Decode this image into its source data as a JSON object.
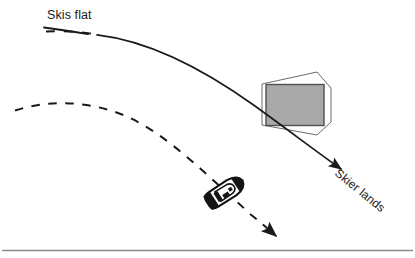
{
  "figure": {
    "type": "diagram",
    "background_color": "#ffffff",
    "width": 415,
    "height": 258
  },
  "labels": {
    "skis_flat": "Skis flat",
    "skier_lands": "Skier lands"
  },
  "colors": {
    "ink": "#1a1a1a",
    "ramp_fill": "#a9a9a9",
    "ramp_stroke": "#555555",
    "outline_stroke": "#666666",
    "water_line": "#8a8a8a",
    "boat_body": "#ffffff",
    "boat_outline": "#111111"
  },
  "elements": {
    "skier_path": {
      "name": "skier-flight-path",
      "style": "solid-with-dashed-start",
      "description": "skier trajectory arcing over the ramp and down to landing",
      "arrowhead": true,
      "points": [
        [
          44,
          31
        ],
        [
          96,
          35
        ],
        [
          160,
          56
        ],
        [
          225,
          88
        ],
        [
          290,
          127
        ],
        [
          345,
          172
        ]
      ]
    },
    "boat_path": {
      "name": "boat-wake-path",
      "style": "dashed",
      "description": "dashed curve showing boat track passing the ramp",
      "arrowhead": true,
      "points": [
        [
          15,
          110
        ],
        [
          70,
          101
        ],
        [
          130,
          115
        ],
        [
          185,
          152
        ],
        [
          232,
          192
        ],
        [
          285,
          240
        ]
      ]
    },
    "ramp": {
      "name": "jump-ramp",
      "fill": "#a9a9a9",
      "rect": [
        266,
        84,
        58,
        41
      ],
      "outline_polygon": [
        [
          262,
          84
        ],
        [
          317,
          72
        ],
        [
          331,
          87
        ],
        [
          331,
          122
        ],
        [
          317,
          135
        ],
        [
          262,
          125
        ]
      ]
    },
    "boat": {
      "name": "tow-boat",
      "position": [
        225,
        192
      ],
      "rotation_deg": -33,
      "length": 42,
      "width": 17
    },
    "water_line": {
      "name": "water-surface-line",
      "y": 250,
      "x_start": 2,
      "x_end": 413,
      "color": "#8a8a8a"
    },
    "skis_flat_underline": {
      "name": "skis-flat-underline",
      "points": [
        [
          45,
          27
        ],
        [
          100,
          35
        ]
      ]
    }
  }
}
